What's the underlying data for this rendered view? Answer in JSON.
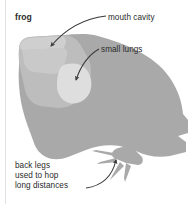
{
  "figure": {
    "title": "frog",
    "background_color": "#ffffff",
    "body_color": "#a9a9a9",
    "head_color": "#bdbdbd",
    "mouth_cavity_color": "#c7c7c7",
    "lungs_color": "#dcdcdc",
    "text_color": "#2b2b2b",
    "arrow_color": "#3a3a3a"
  },
  "labels": {
    "frog": "frog",
    "mouth_cavity": "mouth cavity",
    "small_lungs": "small lungs",
    "back_legs": {
      "line1": "back legs",
      "line2": "used to hop",
      "line3": "long distances"
    }
  },
  "annotations": [
    {
      "name": "mouth-cavity",
      "text": "mouth cavity",
      "points_to": "mouth cavity inside head"
    },
    {
      "name": "small-lungs",
      "text": "small lungs",
      "points_to": "lungs in upper chest"
    },
    {
      "name": "back-legs",
      "text": "back legs used to hop long distances",
      "points_to": "hind leg and foot"
    }
  ]
}
